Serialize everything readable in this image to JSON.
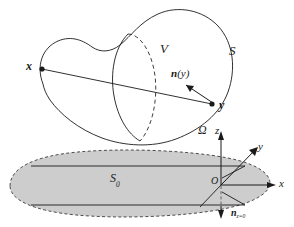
{
  "figure": {
    "background_color": "#ffffff",
    "stroke_color": "#1a1a1a",
    "fill_gray": "#cdcdcd",
    "dash_color": "#555555"
  },
  "upper_body": {
    "volume_label": "V",
    "surface_label": "S",
    "normal_label_n": "n",
    "normal_label_arg": "(y)",
    "point_x": "x",
    "point_y": "y"
  },
  "lower_plane": {
    "domain_label": "Ω",
    "region_label_base": "S",
    "region_label_sub": "0",
    "origin_label": "O",
    "axis_x": "x",
    "axis_y": "y",
    "axis_z": "z",
    "normal_base": "n",
    "normal_sub": "z=0"
  }
}
